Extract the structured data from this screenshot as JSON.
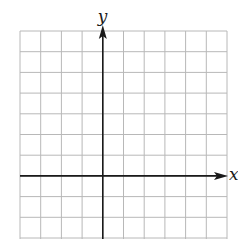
{
  "figure": {
    "type": "coordinate-grid",
    "x_axis_label": "x",
    "y_axis_label": "y",
    "grid": {
      "columns": 10,
      "left": 20,
      "right": 227,
      "top": 31,
      "cell_size": 20.7,
      "rows_visible": 10,
      "y_axis_column_index": 4,
      "x_axis_row_index": 7
    },
    "colors": {
      "grid_line": "#b8b8b8",
      "axis": "#1a1a1a",
      "background": "#ffffff"
    }
  }
}
